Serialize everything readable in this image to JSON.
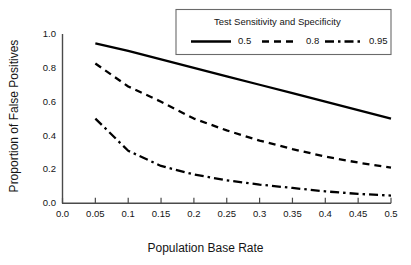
{
  "chart_data": {
    "type": "line",
    "title": "",
    "xlabel": "Population Base Rate",
    "ylabel": "Proportion of False Positives",
    "xlim": [
      0.0,
      0.5
    ],
    "ylim": [
      0.0,
      1.0
    ],
    "xticks": [
      "0.0",
      "0.05",
      "0.1",
      "0.15",
      "0.2",
      "0.25",
      "0.3",
      "0.35",
      "0.4",
      "0.45",
      "0.5"
    ],
    "xtick_values": [
      0.0,
      0.05,
      0.1,
      0.15,
      0.2,
      0.25,
      0.3,
      0.35,
      0.4,
      0.45,
      0.5
    ],
    "yticks": [
      "0.0",
      "0.2",
      "0.4",
      "0.6",
      "0.8",
      "1.0"
    ],
    "ytick_values": [
      0.0,
      0.2,
      0.4,
      0.6,
      0.8,
      1.0
    ],
    "grid": false,
    "legend_position": "top-right",
    "legend_title": "Test Sensitivity and Specificity",
    "x": [
      0.05,
      0.1,
      0.15,
      0.2,
      0.25,
      0.3,
      0.35,
      0.4,
      0.45,
      0.5
    ],
    "series": [
      {
        "name": "0.5",
        "style": "solid",
        "color": "#000000",
        "values": [
          0.945,
          0.9,
          0.85,
          0.8,
          0.75,
          0.7,
          0.65,
          0.6,
          0.55,
          0.5
        ]
      },
      {
        "name": "0.8",
        "style": "dashed",
        "color": "#000000",
        "values": [
          0.826,
          0.69,
          0.6,
          0.5,
          0.43,
          0.37,
          0.32,
          0.275,
          0.24,
          0.21
        ]
      },
      {
        "name": "0.95",
        "style": "dashdot",
        "color": "#000000",
        "values": [
          0.5,
          0.31,
          0.22,
          0.17,
          0.135,
          0.11,
          0.09,
          0.07,
          0.055,
          0.045
        ]
      }
    ]
  },
  "axes": {
    "xlabel": "Population Base Rate",
    "ylabel": "Proportion of False Positives"
  },
  "legend": {
    "title": "Test Sensitivity and Specificity",
    "entries": [
      {
        "label": "0.5",
        "style": "solid"
      },
      {
        "label": "0.8",
        "style": "dashed"
      },
      {
        "label": "0.95",
        "style": "dashdot"
      }
    ]
  },
  "colors": {
    "line": "#000000",
    "text": "#141414",
    "axis": "#3a3a3a",
    "background": "#ffffff"
  }
}
